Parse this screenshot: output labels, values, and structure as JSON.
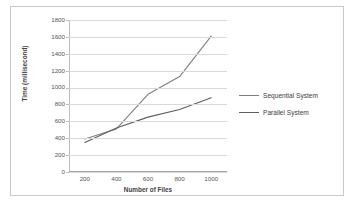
{
  "chart_data": {
    "type": "line",
    "title": "",
    "xlabel": "Number of Files",
    "ylabel": "Time (millisecond)",
    "categories": [
      "200",
      "400",
      "600",
      "800",
      "1000"
    ],
    "x": [
      200,
      400,
      600,
      800,
      1000
    ],
    "ylim": [
      0,
      1800
    ],
    "yticks": [
      "0",
      "200",
      "400",
      "600",
      "800",
      "1000",
      "1200",
      "1400",
      "1600",
      "1800"
    ],
    "ytick_values": [
      0,
      200,
      400,
      600,
      800,
      1000,
      1200,
      1400,
      1600,
      1800
    ],
    "grid": "horizontal",
    "legend_position": "right",
    "series": [
      {
        "name": "Sequential System",
        "values": [
          390,
          510,
          920,
          1130,
          1610
        ],
        "color": "#7f7f7f"
      },
      {
        "name": "Parallel System",
        "values": [
          350,
          520,
          650,
          740,
          880
        ],
        "color": "#5e5e5e"
      }
    ]
  },
  "legend": {
    "items": [
      {
        "label": "Sequential System"
      },
      {
        "label": "Parallel System"
      }
    ]
  }
}
